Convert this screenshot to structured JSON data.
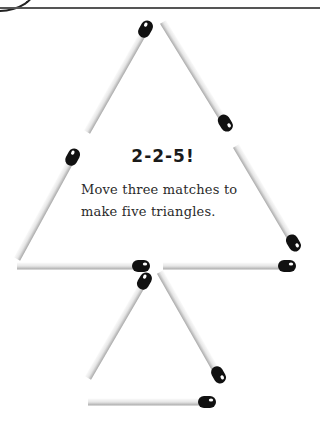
{
  "puzzle": {
    "title": "2-2-5!",
    "description_line1": "Move three matches to",
    "description_line2": "make five triangles."
  },
  "matches": [
    {
      "name": "match-top-left",
      "x1": 87,
      "y1": 132,
      "x2": 149,
      "y2": 23,
      "head": "end"
    },
    {
      "name": "match-top-right",
      "x1": 163,
      "y1": 22,
      "x2": 229,
      "y2": 129,
      "head": "end"
    },
    {
      "name": "match-left-lower",
      "x1": 17,
      "y1": 259,
      "x2": 76,
      "y2": 151,
      "head": "end"
    },
    {
      "name": "match-right-lower",
      "x1": 236,
      "y1": 146,
      "x2": 297,
      "y2": 249,
      "head": "end"
    },
    {
      "name": "match-bottom-left",
      "x1": 17,
      "y1": 266,
      "x2": 148,
      "y2": 266,
      "head": "end"
    },
    {
      "name": "match-bottom-right",
      "x1": 163,
      "y1": 266,
      "x2": 294,
      "y2": 266,
      "head": "end"
    },
    {
      "name": "match-small-left",
      "x1": 88,
      "y1": 378,
      "x2": 148,
      "y2": 275,
      "head": "end"
    },
    {
      "name": "match-small-right",
      "x1": 160,
      "y1": 272,
      "x2": 222,
      "y2": 381,
      "head": "end"
    },
    {
      "name": "match-small-bottom",
      "x1": 88,
      "y1": 402,
      "x2": 214,
      "y2": 402,
      "head": "end"
    }
  ],
  "colors": {
    "stick_light": "#f2f2f2",
    "stick_dark": "#b8b8b8",
    "head": "#111111",
    "highlight": "#ffffff"
  }
}
